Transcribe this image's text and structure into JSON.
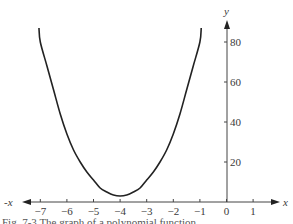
{
  "chart_data": {
    "type": "line",
    "title": "",
    "xlabel": "x",
    "xlabel_negative": "-x",
    "ylabel": "y",
    "xlim": [
      -7.6,
      1.9
    ],
    "ylim": [
      0,
      90
    ],
    "grid": false,
    "legend": null,
    "x_ticks": [
      -7,
      -6,
      -5,
      -4,
      -3,
      -2,
      -1,
      0,
      1
    ],
    "x_tick_labels": [
      "−7",
      "−6",
      "−5",
      "−4",
      "−3",
      "−2",
      "−1",
      "0",
      "1"
    ],
    "y_ticks": [
      20,
      40,
      60,
      80
    ],
    "y_tick_labels": [
      "20",
      "40",
      "60",
      "80"
    ],
    "series": [
      {
        "name": "curve",
        "color": "#222222",
        "x": [
          -7.05,
          -7.0,
          -6.75,
          -6.5,
          -6.25,
          -6.0,
          -5.75,
          -5.5,
          -5.25,
          -5.0,
          -4.75,
          -4.5,
          -4.25,
          -4.0,
          -3.75,
          -3.5,
          -3.25,
          -3.0,
          -2.75,
          -2.5,
          -2.25,
          -2.0,
          -1.75,
          -1.5,
          -1.25,
          -1.0,
          -0.95
        ],
        "y": [
          87,
          80,
          68,
          56,
          44,
          34,
          26,
          20,
          15,
          11,
          7,
          5,
          3.5,
          3,
          3.5,
          5,
          7,
          11,
          15,
          20,
          26,
          34,
          44,
          56,
          68,
          80,
          87
        ]
      }
    ]
  },
  "caption": "Fig. 7-3  The graph of a polynomial function"
}
